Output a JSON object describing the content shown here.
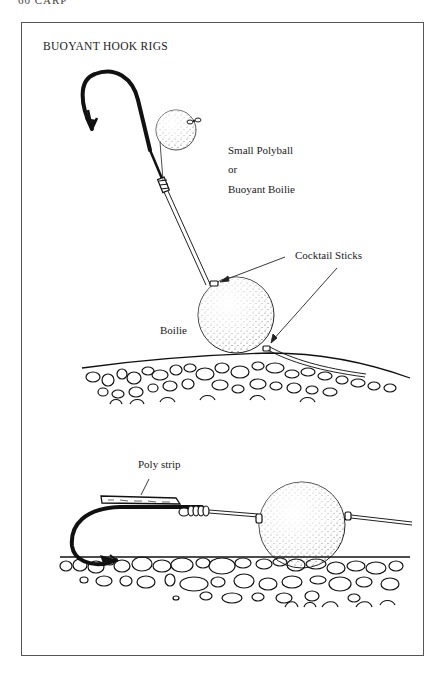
{
  "page": {
    "running_head": "60 CARP",
    "figure_title": "BUOYANT HOOK RIGS"
  },
  "top_rig": {
    "labels": {
      "polyball_line1": "Small Polyball",
      "polyball_line2": "or",
      "polyball_line3": "Buoyant Boilie",
      "cocktail_sticks": "Cocktail Sticks",
      "boilie": "Boilie"
    }
  },
  "bottom_rig": {
    "labels": {
      "poly_strip": "Poly strip"
    }
  }
}
